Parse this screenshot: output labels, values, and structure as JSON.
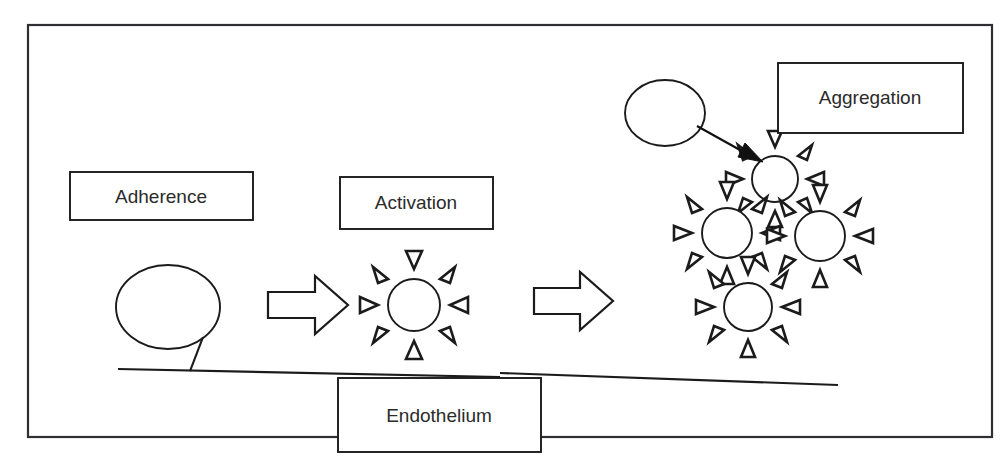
{
  "diagram": {
    "background_color": "#ffffff",
    "line_color": "#1b1b1b",
    "frame_color": "#2e2e33",
    "text_color": "#2b2b2b",
    "labels": {
      "adherence": "Adherence",
      "activation": "Activation",
      "aggregation": "Aggregation",
      "endothelium": "Endothelium"
    },
    "shapes": {
      "resting_platelet_name": "resting-platelet-ellipse",
      "activated_platelet_name": "activated-platelet-spiky",
      "aggregate_count": 4,
      "spikes_per_platelet": 8,
      "block_arrow_count": 2,
      "thin_arrow_count": 1
    }
  }
}
